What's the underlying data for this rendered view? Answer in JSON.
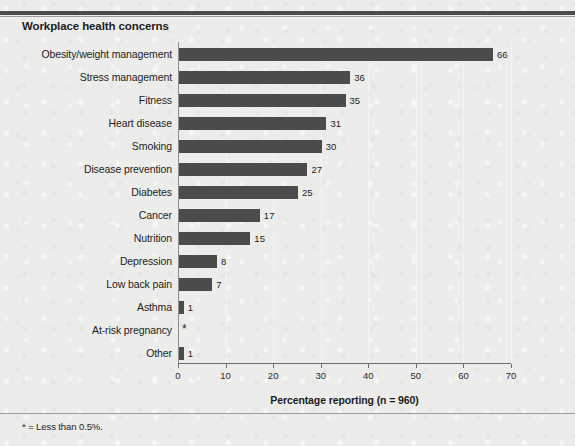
{
  "figure": {
    "title": "Workplace health concerns",
    "footnote": "* = Less than 0.5%.",
    "scan_residue": "",
    "colors": {
      "bar": "#4b4b4b",
      "background": "#ececea",
      "axis": "#6e6e6c",
      "gridline": "#f4f4f2",
      "text": "#1d1d1d",
      "rule": "#4c4c4c"
    }
  },
  "chart_data": {
    "type": "bar",
    "orientation": "horizontal",
    "title": "Workplace health concerns",
    "xlabel": "Percentage reporting (n = 960)",
    "ylabel": "",
    "xlim": [
      0,
      70
    ],
    "xticks": [
      0,
      10,
      20,
      30,
      40,
      50,
      60,
      70
    ],
    "xtick_labels": [
      "0",
      "10",
      "20",
      "30",
      "40",
      "50",
      "60",
      "70"
    ],
    "grid": true,
    "grid_axis": "x",
    "legend": false,
    "sample_size": 960,
    "footnote": "* = Less than 0.5%.",
    "categories": [
      "Obesity/weight management",
      "Stress management",
      "Fitness",
      "Heart disease",
      "Smoking",
      "Disease prevention",
      "Diabetes",
      "Cancer",
      "Nutrition",
      "Depression",
      "Low back pain",
      "Asthma",
      "At-risk pregnancy",
      "Other"
    ],
    "values": [
      66,
      36,
      35,
      31,
      30,
      27,
      25,
      17,
      15,
      8,
      7,
      1,
      0,
      1
    ],
    "value_labels": [
      "66",
      "36",
      "35",
      "31",
      "30",
      "27",
      "25",
      "17",
      "15",
      "8",
      "7",
      "1",
      "*",
      "1"
    ],
    "bars": [
      {
        "category": "Obesity/weight management",
        "value": 66,
        "label": "66"
      },
      {
        "category": "Stress management",
        "value": 36,
        "label": "36"
      },
      {
        "category": "Fitness",
        "value": 35,
        "label": "35"
      },
      {
        "category": "Heart disease",
        "value": 31,
        "label": "31"
      },
      {
        "category": "Smoking",
        "value": 30,
        "label": "30"
      },
      {
        "category": "Disease prevention",
        "value": 27,
        "label": "27"
      },
      {
        "category": "Diabetes",
        "value": 25,
        "label": "25"
      },
      {
        "category": "Cancer",
        "value": 17,
        "label": "17"
      },
      {
        "category": "Nutrition",
        "value": 15,
        "label": "15"
      },
      {
        "category": "Depression",
        "value": 8,
        "label": "8"
      },
      {
        "category": "Low back pain",
        "value": 7,
        "label": "7"
      },
      {
        "category": "Asthma",
        "value": 1,
        "label": "1"
      },
      {
        "category": "At-risk pregnancy",
        "value": 0,
        "label": "*"
      },
      {
        "category": "Other",
        "value": 1,
        "label": "1"
      }
    ]
  }
}
